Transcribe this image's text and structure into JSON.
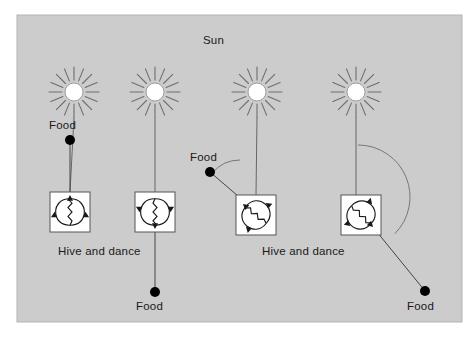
{
  "figure": {
    "title_label": "Sun",
    "panel_background": "#cccccc",
    "page_background": "#ffffff",
    "border_color": "#b3b3b3",
    "ink_color": "#1a1a1a",
    "ray_color": "#6e6e6e",
    "sun_disc_color": "#ffffff",
    "food_dot_color": "#000000",
    "hive_box_fill": "#ffffff",
    "panel": {
      "x": 17,
      "y": 15,
      "width": 445,
      "height": 307
    }
  },
  "labels": {
    "sun": "Sun",
    "food": "Food",
    "hive_and_dance": "Hive and dance"
  },
  "panels": [
    {
      "id": "panel-1",
      "sun_label": "Sun",
      "sun": {
        "cx": 74,
        "cy": 92,
        "r": 9,
        "rays": 16,
        "ray_inner": 12,
        "ray_outer": 25
      },
      "hive": {
        "x": 50,
        "y": 192,
        "size": 40
      },
      "food": {
        "cx": 70,
        "cy": 140,
        "r": 5,
        "label": "Food",
        "label_x": 49,
        "label_y": 119
      },
      "sun_line": {
        "x1": 74,
        "y1": 117,
        "x2": 70,
        "y2": 192
      },
      "food_line": {
        "x1": 70,
        "y1": 140,
        "x2": 70,
        "y2": 192
      },
      "dance_angle_deg": 0,
      "angle_arc": null,
      "hive_label": "Hive and dance",
      "hive_label_x": 58,
      "hive_label_y": 245,
      "show_hive_label": true
    },
    {
      "id": "panel-2",
      "sun": {
        "cx": 155,
        "cy": 92,
        "r": 9,
        "rays": 16,
        "ray_inner": 12,
        "ray_outer": 25
      },
      "hive": {
        "x": 135,
        "y": 192,
        "size": 40
      },
      "food": {
        "cx": 155,
        "cy": 292,
        "r": 5,
        "label": "Food",
        "label_x": 136,
        "label_y": 300
      },
      "sun_line": {
        "x1": 155,
        "y1": 117,
        "x2": 155,
        "y2": 192
      },
      "food_line": {
        "x1": 155,
        "y1": 232,
        "x2": 155,
        "y2": 292
      },
      "dance_angle_deg": 180,
      "angle_arc": null,
      "hive_label": "",
      "show_hive_label": false
    },
    {
      "id": "panel-3",
      "sun": {
        "cx": 257,
        "cy": 92,
        "r": 9,
        "rays": 16,
        "ray_inner": 12,
        "ray_outer": 25
      },
      "hive": {
        "x": 236,
        "y": 195,
        "size": 40
      },
      "food": {
        "cx": 210,
        "cy": 172,
        "r": 5,
        "label": "Food",
        "label_x": 190,
        "label_y": 151
      },
      "sun_line": {
        "x1": 257,
        "y1": 117,
        "x2": 256,
        "y2": 195
      },
      "food_line": {
        "x1": 210,
        "y1": 172,
        "x2": 238,
        "y2": 196
      },
      "dance_angle_deg": -50,
      "angle_arc": {
        "cx": 240,
        "cy": 196,
        "r": 36,
        "start_deg": -90,
        "end_deg": -140
      },
      "hive_label": "Hive and dance",
      "hive_label_x": 262,
      "hive_label_y": 245,
      "show_hive_label": true
    },
    {
      "id": "panel-4",
      "sun": {
        "cx": 356,
        "cy": 92,
        "r": 9,
        "rays": 16,
        "ray_inner": 12,
        "ray_outer": 25
      },
      "hive": {
        "x": 341,
        "y": 195,
        "size": 40
      },
      "food": {
        "cx": 425,
        "cy": 291,
        "r": 5,
        "label": "Food",
        "label_x": 407,
        "label_y": 300
      },
      "sun_line": {
        "x1": 356,
        "y1": 117,
        "x2": 356,
        "y2": 195
      },
      "food_line": {
        "x1": 377,
        "y1": 232,
        "x2": 425,
        "y2": 291
      },
      "dance_angle_deg": 135,
      "angle_arc": {
        "cx": 358,
        "cy": 197,
        "r": 52,
        "start_deg": -90,
        "end_deg": 45
      },
      "hive_label": "",
      "show_hive_label": false
    }
  ],
  "sun_title": {
    "text": "Sun",
    "x": 203,
    "y": 34
  }
}
